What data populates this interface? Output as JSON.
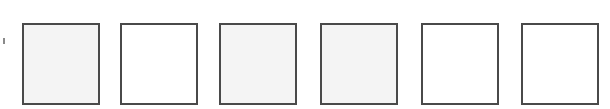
{
  "edge_mark": {
    "visible": true
  },
  "boxes": [
    {
      "index": 1,
      "fill": "shaded",
      "left": 22
    },
    {
      "index": 2,
      "fill": "plain",
      "left": 120
    },
    {
      "index": 3,
      "fill": "shaded",
      "left": 219
    },
    {
      "index": 4,
      "fill": "shaded",
      "left": 320
    },
    {
      "index": 5,
      "fill": "plain",
      "left": 421
    },
    {
      "index": 6,
      "fill": "plain",
      "left": 521
    }
  ],
  "colors": {
    "border": "#4a4a4a",
    "shaded": "#f4f4f4",
    "plain": "#ffffff"
  }
}
